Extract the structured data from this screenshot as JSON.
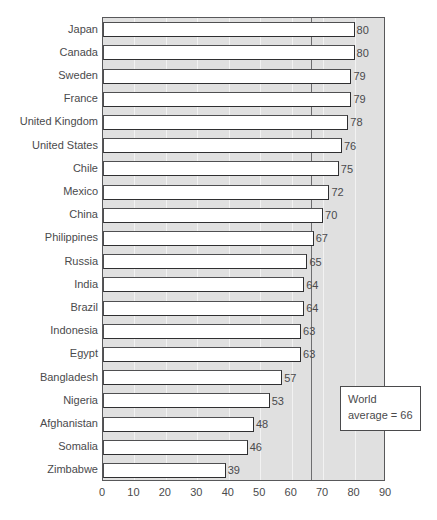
{
  "chart_data": {
    "type": "bar",
    "orientation": "horizontal",
    "title": "",
    "subtitle": "",
    "xlabel": "",
    "ylabel": "",
    "xlim": [
      0,
      90
    ],
    "xticks": [
      0,
      10,
      20,
      30,
      40,
      50,
      60,
      70,
      80,
      90
    ],
    "grid": true,
    "legend": null,
    "categories": [
      "Japan",
      "Canada",
      "Sweden",
      "France",
      "United Kingdom",
      "United States",
      "Chile",
      "Mexico",
      "China",
      "Philippines",
      "Russia",
      "India",
      "Brazil",
      "Indonesia",
      "Egypt",
      "Bangladesh",
      "Nigeria",
      "Afghanistan",
      "Somalia",
      "Zimbabwe"
    ],
    "values": [
      80,
      80,
      79,
      79,
      78,
      76,
      75,
      72,
      70,
      67,
      65,
      64,
      64,
      63,
      63,
      57,
      53,
      48,
      46,
      39
    ],
    "bar_labels": [
      "80",
      "80",
      "79",
      "79",
      "78",
      "76",
      "75",
      "72",
      "70",
      "67",
      "65",
      "64",
      "64",
      "63",
      "63",
      "57",
      "53",
      "48",
      "46",
      "39"
    ],
    "reference_line": {
      "value": 66,
      "label_line1": "World",
      "label_line2": "average = 66"
    },
    "colors": {
      "bar_fill": "#ffffff",
      "bar_stroke": "#4f4f51",
      "plot_background": "#e0e0e0",
      "plot_border": "#58585a",
      "gridline": "#f2f2f2",
      "reference_line": "#6e6e70",
      "text": "#4a4a4c",
      "callout_background": "#ffffff",
      "callout_border": "#4a4a4c"
    }
  },
  "callout": {
    "line1": "World",
    "line2": "average = 66"
  }
}
